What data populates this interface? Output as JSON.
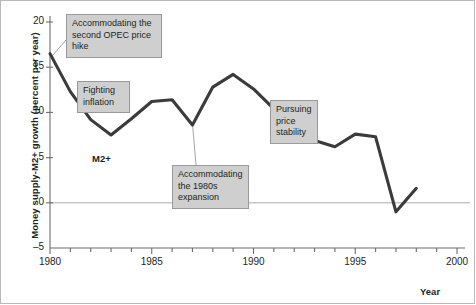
{
  "chart_data": {
    "type": "line",
    "title": "",
    "xlabel": "Year",
    "ylabel": "Money supply-M2+ growth (percent per year)",
    "xlim": [
      1980,
      2000
    ],
    "ylim": [
      -5,
      20
    ],
    "grid": false,
    "zero_line": true,
    "series_name": "M2+",
    "x": [
      1980,
      1981,
      1982,
      1983,
      1984,
      1985,
      1986,
      1987,
      1988,
      1989,
      1990,
      1991,
      1992,
      1993,
      1994,
      1995,
      1996,
      1997,
      1998
    ],
    "values": [
      16.5,
      12.3,
      9.2,
      7.5,
      9.3,
      11.2,
      11.4,
      8.6,
      12.8,
      14.2,
      12.6,
      10.4,
      8.2,
      6.9,
      6.2,
      7.6,
      7.3,
      -1.0,
      1.6
    ],
    "ytick_values": [
      -5,
      0,
      5,
      10,
      15,
      20
    ],
    "ytick_labels": [
      "–5",
      "0",
      "5",
      "10",
      "15",
      "20"
    ],
    "xtick_labels": [
      "1980",
      "1985",
      "1990",
      "1995",
      "2000"
    ],
    "xtick_values": [
      1980,
      1985,
      1990,
      1995,
      2000
    ],
    "minor_xticks_every": 1,
    "line_color": "#3b3b3b",
    "zero_line_color": "#c6c6c6",
    "axis_color": "#6d6d6d",
    "callout_fill": "#cfcfcf",
    "callout_border": "#9a9a9a"
  },
  "annotations": [
    {
      "id": "opec",
      "text": "Accommodating the second OPEC price hike",
      "anchor_year": 1980,
      "anchor_value": 16.5
    },
    {
      "id": "fight",
      "text": "Fighting inflation",
      "anchor_year": 1981.6,
      "anchor_value": 11.0
    },
    {
      "id": "expand",
      "text": "Accommodating the 1980s expansion",
      "anchor_year": 1987,
      "anchor_value": 8.6
    },
    {
      "id": "price",
      "text": "Pursuing price stability",
      "anchor_year": 1992.6,
      "anchor_value": 8.2
    }
  ],
  "series_label": "M2+"
}
